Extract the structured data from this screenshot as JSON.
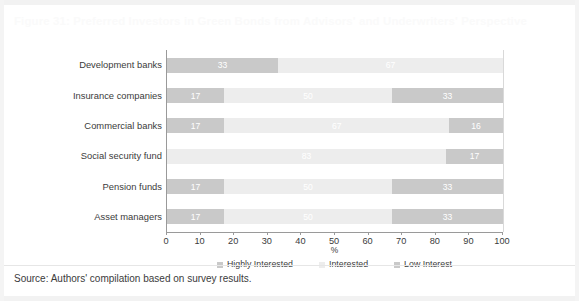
{
  "figure": {
    "title": "Figure 31: Preferred Investors in Green Bonds from Advisors' and Underwriters' Perspective",
    "source": "Source: Authors' compilation based on survey results."
  },
  "colors": {
    "highly_interested": "#c9c9c9",
    "interested": "#ededed",
    "low_interest": "#c9c9c9",
    "axis": "#9a9a9a",
    "text": "#3b3b3b",
    "title": "#fafafa"
  },
  "chart_data": {
    "type": "bar",
    "orientation": "horizontal",
    "stacked": true,
    "title": "Figure 31: Preferred Investors in Green Bonds from Advisors' and Underwriters' Perspective",
    "xlabel": "%",
    "ylabel": "",
    "xlim": [
      0,
      100
    ],
    "xticks": [
      "0",
      "10",
      "20",
      "30",
      "40",
      "50",
      "60",
      "70",
      "80",
      "90",
      "100"
    ],
    "grid": false,
    "legend_position": "bottom-center",
    "categories": [
      "Development banks",
      "Insurance companies",
      "Commercial banks",
      "Social security fund",
      "Pension funds",
      "Asset managers"
    ],
    "series": [
      {
        "name": "Highly Interested",
        "color": "#c9c9c9",
        "values": [
          33,
          17,
          17,
          0,
          17,
          17
        ],
        "labels": [
          "33",
          "17",
          "17",
          "",
          "17",
          "17"
        ]
      },
      {
        "name": "Interested",
        "color": "#ededed",
        "values": [
          67,
          50,
          67,
          83,
          50,
          50
        ],
        "labels": [
          "67",
          "50",
          "67",
          "83",
          "50",
          "50"
        ]
      },
      {
        "name": "Low Interest",
        "color": "#c9c9c9",
        "values": [
          0,
          33,
          16,
          17,
          33,
          33
        ],
        "labels": [
          "",
          "33",
          "16",
          "17",
          "33",
          "33"
        ]
      }
    ]
  }
}
